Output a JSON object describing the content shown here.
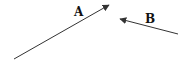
{
  "diagram": {
    "vectors": [
      {
        "label": "A",
        "from": [
          14,
          59
        ],
        "to": [
          109,
          5
        ],
        "label_pos": [
          74,
          16
        ]
      },
      {
        "label": "B",
        "from": [
          178,
          34
        ],
        "to": [
          120,
          19
        ],
        "label_pos": [
          145,
          23
        ]
      }
    ],
    "stroke_color": "#333333",
    "label_color": "#111111"
  }
}
